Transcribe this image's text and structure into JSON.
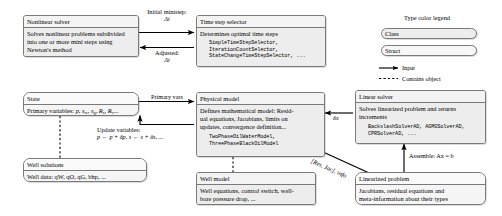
{
  "diagram": {
    "colors": {
      "class_fill": "#ededed",
      "struct_fill": "#f7f7f7",
      "border": "#7a7a7a",
      "arrow": "#000000"
    },
    "nodes": {
      "nonlinear_solver": {
        "kind": "class",
        "title": "Nonlinear solver",
        "body_lines": [
          "Solves nonlinear problems subdivided",
          "into one or more mini steps using",
          "Newton's method"
        ]
      },
      "time_step_selector": {
        "kind": "class",
        "title": "Time step selector",
        "body_lines": [
          "Determines optimal time steps"
        ],
        "mono_lines": [
          "SimpleTimeStepSelector,",
          "IterationCountSelector,",
          "StateChangeTimeStepSelector, ..."
        ]
      },
      "state": {
        "kind": "struct",
        "title": "State",
        "body_lines": [
          "Primary variables: p, s_w, s_g, R_s, R_v..."
        ]
      },
      "physical_model": {
        "kind": "class",
        "title": "Physical model",
        "body_lines": [
          "Defines mathematical model: Resid-",
          "ual equations, Jacobians, limits on",
          "updates, convergence definition..."
        ],
        "mono_lines": [
          "TwoPhaseOilWaterModel,",
          "ThreePhaseBlackOilModel"
        ]
      },
      "linear_solver": {
        "kind": "class",
        "title": "Linear solver",
        "body_lines": [
          "Solves linearized problem and returns",
          "increments"
        ],
        "mono_lines": [
          "BackslashSolverAD, AGMGSolverAD,",
          "CPRSolverAD, ..."
        ]
      },
      "well_solutions": {
        "kind": "struct",
        "title": "Well solutions",
        "body_lines": [
          "Well data: qW, qO, qG, bhp, ..."
        ]
      },
      "well_model": {
        "kind": "class",
        "title": "Well model",
        "body_lines": [
          "Well equations, control switch, well-",
          "bore pressure drop, ..."
        ]
      },
      "linearized_problem": {
        "kind": "struct",
        "title": "Linearized problem",
        "body_lines": [
          "Jacobians, residual equations and",
          "meta-information about their types"
        ]
      }
    },
    "edge_labels": {
      "initial_ministep": {
        "line1": "Initial ministep:",
        "line2": "Δt"
      },
      "adjusted": {
        "line1": "Adjusted:",
        "line2": "Δt"
      },
      "primary_vars": "Primary vars",
      "update_variables": {
        "line1": "Update variables:",
        "line2": "p ← p + δp, s ← s + δs, ..."
      },
      "increment": "δx",
      "res_jac_info": "[Res, Jac], info",
      "assemble": "Assemble: Ax = b"
    },
    "legend": {
      "title": "Type color legend",
      "class_label": "Class",
      "struct_label": "Struct",
      "input_label": "Input",
      "contains_label": "Contains object"
    }
  }
}
